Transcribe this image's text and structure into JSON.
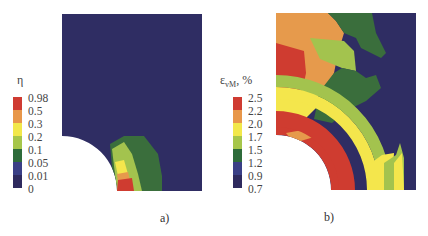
{
  "figure_a": {
    "caption": "a)",
    "legend": {
      "title": "η",
      "labels": [
        "0.98",
        "0.5",
        "0.3",
        "0.2",
        "0.1",
        "0.05",
        "0.01",
        "0"
      ],
      "colors": [
        "#cf3b32",
        "#e8974a",
        "#f2e84a",
        "#a6c64a",
        "#2e6b3a",
        "#3a3f86",
        "#2e2a5e"
      ]
    },
    "plot_description": "Quarter specimen with circular notch at bottom-left; field mostly lowest level (dark navy) with small concentrated region near notch root"
  },
  "figure_b": {
    "caption": "b)",
    "legend": {
      "title": "ε",
      "subscript": "vM",
      "unit": ", %",
      "labels": [
        "2.5",
        "2.2",
        "2.0",
        "1.7",
        "1.5",
        "1.2",
        "0.9",
        "0.7"
      ],
      "colors": [
        "#cf3b32",
        "#e8974a",
        "#f2e84a",
        "#a6c64a",
        "#2e6b3a",
        "#3a3f86",
        "#2e2a5e"
      ]
    },
    "plot_description": "Quarter specimen with circular notch; concentric strain bands around notch and grain-like regions in upper part"
  },
  "colors": {
    "navy": "#2f2d63",
    "dark_green": "#3a6e3c",
    "light_green": "#a3c34e",
    "yellow": "#f4e64c",
    "orange": "#e69a4c",
    "red": "#cf3c30"
  }
}
